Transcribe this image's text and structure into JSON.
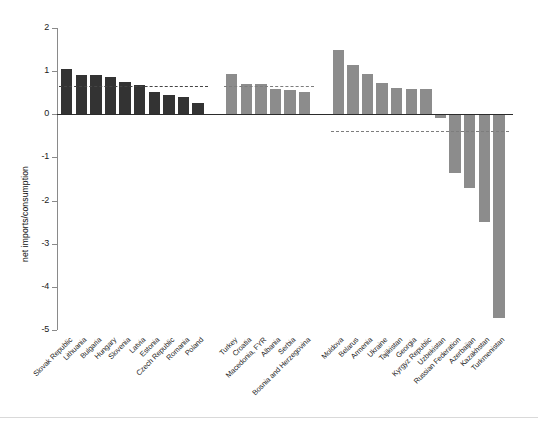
{
  "chart_data": {
    "type": "bar",
    "title": "",
    "subtitle": "",
    "xlabel": "",
    "ylabel": "net imports/consumption",
    "ylim": [
      -5,
      2
    ],
    "yticks": [
      2,
      1,
      0,
      -1,
      -2,
      -3,
      -4,
      -5
    ],
    "ytick_labels": [
      "2",
      "1",
      "0",
      "-1",
      "-2",
      "-3",
      "-4",
      "-5"
    ],
    "grid": false,
    "legend": "none",
    "zero_line": 0,
    "groups": [
      {
        "name": "New EU member states",
        "color": "#333333",
        "reference_line": 0.65,
        "categories": [
          "Slovak Republic",
          "Lithuania",
          "Bulgaria",
          "Hungary",
          "Slovenia",
          "Latvia",
          "Estonia",
          "Czech Republic",
          "Romania",
          "Poland"
        ],
        "values": [
          1.04,
          0.92,
          0.91,
          0.87,
          0.75,
          0.68,
          0.51,
          0.45,
          0.39,
          0.27
        ]
      },
      {
        "name": "Southeastern Europe",
        "color": "#8c8c8c",
        "reference_line": 0.65,
        "categories": [
          "Turkey",
          "Croatia",
          "Macedonia, FYR",
          "Albania",
          "Serbia",
          "Bosnia and Herzegovina"
        ],
        "values": [
          0.93,
          0.71,
          0.7,
          0.59,
          0.57,
          0.52
        ]
      },
      {
        "name": "Commonwealth of Independent States",
        "color": "#8c8c8c",
        "reference_line": -0.39,
        "categories": [
          "Moldova",
          "Belarus",
          "Armenia",
          "Ukraine",
          "Tajikistan",
          "Georgia",
          "Kyrgyz Republic",
          "Uzbekistan",
          "Russian Federation",
          "Azerbaijan",
          "Kazakhstan",
          "Turkmenistan"
        ],
        "values": [
          1.5,
          1.15,
          0.93,
          0.72,
          0.6,
          0.58,
          0.58,
          -0.09,
          -1.35,
          -1.7,
          -2.5,
          -4.73
        ]
      }
    ],
    "colors": {
      "dark_bar": "#333333",
      "light_bar": "#8c8c8c",
      "axis": "#8a8a8a",
      "zero_line": "#2b2b2b",
      "reference_dark": "#444444",
      "reference_light": "#7d7d7d"
    }
  }
}
